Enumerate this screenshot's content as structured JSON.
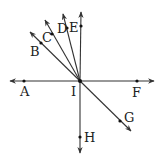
{
  "diagram": {
    "center": {
      "label": "I",
      "x": 80,
      "y": 81
    },
    "line_color": "#333333",
    "rays": [
      {
        "id": "A",
        "tip": [
          10,
          81
        ],
        "dot": [
          24,
          81
        ],
        "label_pos": [
          20,
          96
        ]
      },
      {
        "id": "F",
        "tip": [
          154,
          81
        ],
        "dot": [
          137,
          81
        ],
        "label_pos": [
          132,
          97
        ]
      },
      {
        "id": "E",
        "tip": [
          81,
          12
        ],
        "dot": [
          81,
          26
        ],
        "label_pos": [
          69,
          32
        ]
      },
      {
        "id": "D",
        "tip": [
          63,
          14
        ],
        "dot": [
          67,
          28
        ],
        "label_pos": [
          57,
          33
        ]
      },
      {
        "id": "C",
        "tip": [
          45,
          20
        ],
        "dot": [
          52,
          34
        ],
        "label_pos": [
          42,
          42
        ]
      },
      {
        "id": "B",
        "tip": [
          30,
          32
        ],
        "dot": [
          41,
          43
        ],
        "label_pos": [
          30,
          56
        ]
      },
      {
        "id": "H",
        "tip": [
          80,
          153
        ],
        "dot": [
          80,
          137
        ],
        "label_pos": [
          84,
          142
        ]
      },
      {
        "id": "G",
        "tip": [
          131,
          131
        ],
        "dot": [
          120,
          121
        ],
        "label_pos": [
          124,
          122
        ]
      }
    ],
    "labels": {
      "A": "A",
      "B": "B",
      "C": "C",
      "D": "D",
      "E": "E",
      "F": "F",
      "G": "G",
      "H": "H",
      "I": "I"
    }
  }
}
